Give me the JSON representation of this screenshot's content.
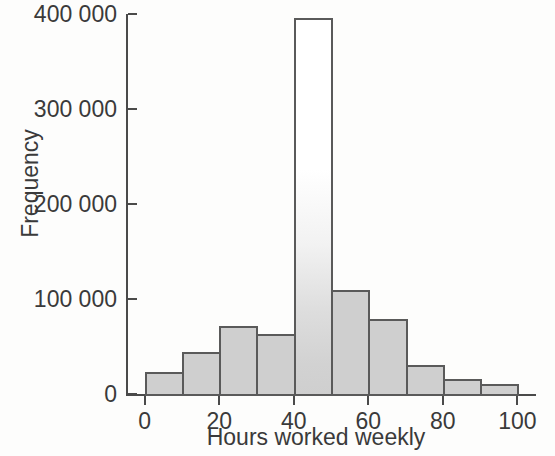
{
  "chart_data": {
    "type": "bar",
    "title": "",
    "subtitle": "",
    "xlabel": "Hours worked weekly",
    "ylabel": "Frequency",
    "grid": false,
    "legend": null,
    "bin_width": 10,
    "xlim": [
      -5,
      105
    ],
    "ylim": [
      0,
      400000
    ],
    "xticks": [
      "0",
      "20",
      "40",
      "60",
      "80",
      "100"
    ],
    "xtick_values": [
      0,
      20,
      40,
      60,
      80,
      100
    ],
    "yticks": [
      "0",
      "100 000",
      "200 000",
      "300 000",
      "400 000"
    ],
    "ytick_values": [
      0,
      100000,
      200000,
      300000,
      400000
    ],
    "bin_edges": [
      0,
      10,
      20,
      30,
      40,
      50,
      60,
      70,
      80,
      90,
      100
    ],
    "categories": [
      "0-10",
      "10-20",
      "20-30",
      "30-40",
      "40-50",
      "50-60",
      "60-70",
      "70-80",
      "80-90",
      "90-100"
    ],
    "values": [
      23000,
      44000,
      72000,
      63000,
      396000,
      110000,
      79000,
      31000,
      16000,
      11000
    ],
    "colors": {
      "bar_fill": "#cfcfcf",
      "bar_fill_tall_top": "#ffffff",
      "bar_edge": "#5a5a5a",
      "axis": "#4a4a4a",
      "text": "#3a3a3a",
      "background": "#fdfdfc"
    }
  }
}
